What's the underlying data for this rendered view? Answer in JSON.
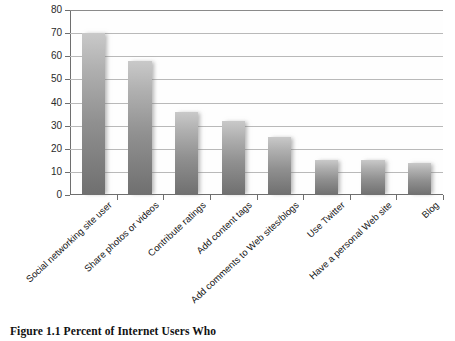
{
  "caption": "Figure 1.1  Percent of Internet Users Who",
  "chart_data": {
    "type": "bar",
    "title": "",
    "xlabel": "",
    "ylabel": "",
    "ylim": [
      0,
      80
    ],
    "ytick_step": 10,
    "yticks": [
      80,
      70,
      60,
      50,
      40,
      30,
      20,
      10,
      0
    ],
    "grid": true,
    "legend": false,
    "categories": [
      "Social networking site user",
      "Share photos or videos",
      "Contribute ratings",
      "Add content tags",
      "Add comments to Web sites/blogs",
      "Use Twitter",
      "Have a personal Web site",
      "Blog"
    ],
    "values": [
      70,
      58,
      36,
      32,
      25,
      15,
      15,
      14
    ],
    "bar_color": "#909090"
  }
}
